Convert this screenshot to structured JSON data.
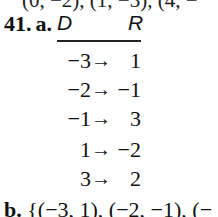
{
  "top_partial_line": "(0, −2), (1, −3), (4, −",
  "problem": {
    "number": "41.",
    "part_a": "a.",
    "domain_header": "D",
    "range_header": "R",
    "mapping": [
      {
        "d": "−3",
        "arrow": "→",
        "r": "1"
      },
      {
        "d": "−2",
        "arrow": "→",
        "r": "−1"
      },
      {
        "d": "−1",
        "arrow": "→",
        "r": "3"
      },
      {
        "d": "1",
        "arrow": "→",
        "r": "−2"
      },
      {
        "d": "3",
        "arrow": "→",
        "r": "2"
      }
    ],
    "part_b": "b.",
    "part_b_text": "{(−3, 1), (−2, −1), (−"
  }
}
